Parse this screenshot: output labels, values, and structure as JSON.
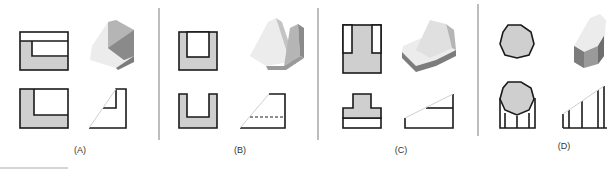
{
  "figure": {
    "panels": [
      {
        "id": "A",
        "label": "(A)",
        "label_x": 80
      },
      {
        "id": "B",
        "label": "(B)",
        "label_x": 240
      },
      {
        "id": "C",
        "label": "(C)",
        "label_x": 401
      },
      {
        "id": "D",
        "label": "(D)",
        "label_x": 564
      }
    ],
    "colors": {
      "line": "#1a1a1a",
      "fill": "#cfcfcf",
      "divider": "#9a9a9a",
      "light_face": "#ececec",
      "mid_face": "#b5b5b5",
      "dark_face": "#7c7c7c"
    }
  }
}
